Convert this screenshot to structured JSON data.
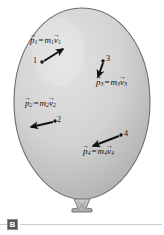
{
  "figure": {
    "part_label": "B",
    "caption_rule": true,
    "balloon": {
      "fill_light": "#dcdcdc",
      "fill_dark": "#b4b4b4",
      "outline": "#6e6e6e",
      "knot_fill": "#c4c4c4"
    },
    "ink_color": "#111111"
  },
  "particles": [
    {
      "id": "1",
      "number": "1",
      "label": {
        "p": "p",
        "p_sub": "1",
        "equals": "=",
        "m": "m",
        "m_sub": "1",
        "v": "v",
        "v_sub": "1",
        "text": "p1 = m1v1"
      },
      "dot": {
        "x": 42,
        "y": 62
      },
      "arrow": {
        "x1": 44,
        "y1": 61,
        "x2": 63,
        "y2": 49
      },
      "label_pos": {
        "x": 30,
        "y": 36
      },
      "number_pos": {
        "x": 33,
        "y": 57
      }
    },
    {
      "id": "3",
      "number": "3",
      "label": {
        "p": "p",
        "p_sub": "3",
        "equals": "=",
        "m": "m",
        "m_sub": "3",
        "v": "v",
        "v_sub": "3",
        "text": "p3 = m3v3"
      },
      "dot": {
        "x": 103,
        "y": 61
      },
      "arrow": {
        "x1": 103,
        "y1": 63,
        "x2": 98,
        "y2": 77
      },
      "label_pos": {
        "x": 96,
        "y": 78
      },
      "number_pos": {
        "x": 106,
        "y": 56
      }
    },
    {
      "id": "2",
      "number": "2",
      "label": {
        "p": "p",
        "p_sub": "2",
        "equals": "=",
        "m": "m",
        "m_sub": "2",
        "v": "v",
        "v_sub": "2",
        "text": "p2 = m2v2"
      },
      "dot": {
        "x": 55,
        "y": 121
      },
      "arrow": {
        "x1": 53,
        "y1": 122,
        "x2": 31,
        "y2": 127
      },
      "label_pos": {
        "x": 25,
        "y": 99
      },
      "number_pos": {
        "x": 57,
        "y": 117
      }
    },
    {
      "id": "4",
      "number": "4",
      "label": {
        "p": "p",
        "p_sub": "4",
        "equals": "=",
        "m": "m",
        "m_sub": "4",
        "v": "v",
        "v_sub": "4",
        "text": "p4 = m4v4"
      },
      "dot": {
        "x": 121,
        "y": 135
      },
      "arrow": {
        "x1": 119,
        "y1": 136,
        "x2": 93,
        "y2": 146
      },
      "label_pos": {
        "x": 83,
        "y": 147
      },
      "number_pos": {
        "x": 124,
        "y": 131
      }
    }
  ]
}
